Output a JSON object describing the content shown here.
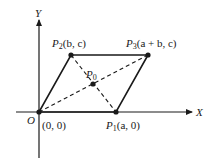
{
  "diagram": {
    "axes": {
      "x_label": "X",
      "y_label": "Y",
      "origin_label": "O"
    },
    "points": {
      "origin": {
        "name": "O",
        "coords": "(0, 0)"
      },
      "p1": {
        "name": "P",
        "sub": "1",
        "coords": "(a, 0)"
      },
      "p2": {
        "name": "P",
        "sub": "2",
        "coords": "(b, c)"
      },
      "p3": {
        "name": "P",
        "sub": "3",
        "coords": "(a + b, c)"
      },
      "p0": {
        "name": "P",
        "sub": "0"
      }
    },
    "colors": {
      "line": "#1a1a1a",
      "background": "#ffffff"
    }
  }
}
